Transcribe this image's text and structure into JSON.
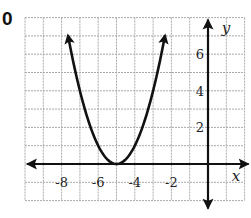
{
  "problem_number": "0",
  "chart_data": {
    "type": "line",
    "title": "",
    "function": "y = (x + 5)^2",
    "vertex": [
      -5,
      0
    ],
    "curve_x_range": [
      -7.65,
      -2.35
    ],
    "xlabel": "x",
    "ylabel": "y",
    "xlim": [
      -10,
      2
    ],
    "ylim": [
      -2,
      8
    ],
    "grid": true,
    "grid_step": 1,
    "x_tick_labels": [
      {
        "value": -8,
        "label": "-8"
      },
      {
        "value": -6,
        "label": "-6"
      },
      {
        "value": -4,
        "label": "-4"
      },
      {
        "value": -2,
        "label": "-2"
      }
    ],
    "y_tick_labels": [
      {
        "value": 2,
        "label": "2"
      },
      {
        "value": 4,
        "label": "4"
      },
      {
        "value": 6,
        "label": "6"
      }
    ],
    "series": [
      {
        "name": "parabola",
        "x": [
          -7.65,
          -7,
          -6,
          -5,
          -4,
          -3,
          -2.35
        ],
        "values": [
          7.02,
          4,
          1,
          0,
          1,
          4,
          7.02
        ],
        "arrows_both_ends": true
      }
    ]
  },
  "colors": {
    "grid": "#a9a9a9",
    "axis": "#111111",
    "curve": "#111111",
    "text": "#222222"
  }
}
